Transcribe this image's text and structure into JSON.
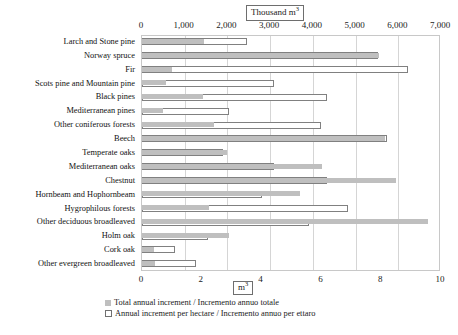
{
  "chart_data": {
    "type": "bar",
    "orientation": "horizontal",
    "title": "",
    "top_axis_unit_label": "Thousand m³",
    "bottom_axis_unit_label": "m³",
    "grid": true,
    "legend_position": "bottom-left",
    "top_axis": {
      "label": "Thousand m³",
      "min": 0,
      "max": 7000,
      "ticks": [
        0,
        1000,
        2000,
        3000,
        4000,
        5000,
        6000,
        7000
      ],
      "tick_labels": [
        "0",
        "1,000",
        "2,000",
        "3,000",
        "4,000",
        "5,000",
        "6,000",
        "7,000"
      ]
    },
    "bottom_axis": {
      "label": "m³",
      "min": 0,
      "max": 10,
      "ticks": [
        0,
        2,
        4,
        6,
        8,
        10
      ],
      "tick_labels": [
        "0",
        "2",
        "4",
        "6",
        "8",
        "10"
      ]
    },
    "categories": [
      "Larch and Stone pine",
      "Norway spruce",
      "Fir",
      "Scots pine and Mountain pine",
      "Black pines",
      "Mediterranean pines",
      "Other coniferous forests",
      "Beech",
      "Temperate oaks",
      "Mediterranean oaks",
      "Chestnut",
      "Hornbeam and Hophornbeam",
      "Hygrophilous forests",
      "Other deciduous broadleaved",
      "Holm oak",
      "Cork oak",
      "Other evergreen broadleaved"
    ],
    "series": [
      {
        "name": "Total annual increment / Incremento annuo totale",
        "key": "total",
        "unit": "Thousand m³",
        "axis": "top",
        "style": "filled-gray",
        "color": "#bfbfbf",
        "values": [
          1440,
          5560,
          710,
          560,
          1420,
          480,
          1680,
          5680,
          1980,
          4220,
          5940,
          3690,
          1560,
          6700,
          2040,
          280,
          300
        ]
      },
      {
        "name": "Annual increment per hectare / Incremento annuo per ettaro",
        "key": "per_hectare",
        "unit": "m³",
        "axis": "bottom",
        "style": "open-outline",
        "color": "#ffffff",
        "border_color": "#808080",
        "values": [
          3.5,
          7.9,
          8.9,
          4.4,
          6.2,
          2.9,
          6.0,
          8.2,
          2.7,
          4.4,
          6.2,
          4.0,
          6.9,
          5.6,
          2.2,
          1.1,
          1.8
        ]
      }
    ],
    "legend": [
      {
        "marker": "filled-square",
        "label": "Total annual increment / Incremento annuo totale"
      },
      {
        "marker": "open-square",
        "label": "Annual increment per hectare / Incremento annuo per ettaro"
      }
    ]
  }
}
